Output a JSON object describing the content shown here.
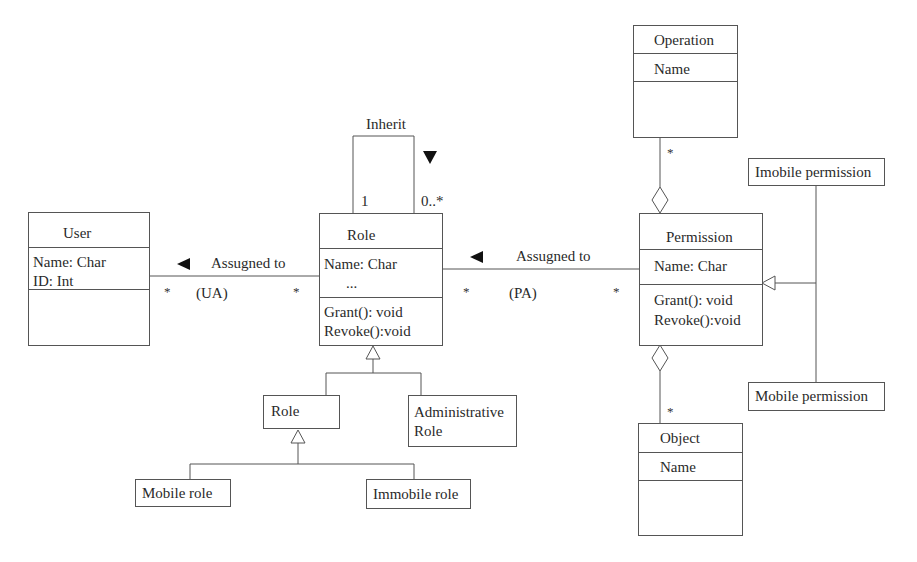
{
  "classes": {
    "user": {
      "name": "User",
      "attributes": [
        "Name: Char",
        "ID: Int"
      ],
      "operations": []
    },
    "role": {
      "name": "Role",
      "attributes": [
        "Name: Char",
        "..."
      ],
      "operations": [
        "Grant(): void",
        "Revoke():void"
      ]
    },
    "permission": {
      "name": "Permission",
      "attributes": [
        "Name: Char"
      ],
      "operations": [
        "Grant(): void",
        "Revoke():void"
      ]
    },
    "operation": {
      "name": "Operation",
      "attributes": [
        "Name"
      ],
      "operations": []
    },
    "object": {
      "name": "Object",
      "attributes": [
        "Name"
      ],
      "operations": []
    },
    "sub_role": {
      "name": "Role"
    },
    "administrative_role": {
      "name_line1": "Administrative",
      "name_line2": "Role"
    },
    "mobile_role": {
      "name": "Mobile role"
    },
    "immobile_role": {
      "name": "Immobile role"
    },
    "imobile_permission": {
      "name": "Imobile permission"
    },
    "mobile_permission": {
      "name": "Mobile permission"
    }
  },
  "associations": {
    "ua": {
      "label": "Assugned to",
      "abbrev": "(UA)",
      "mult_left": "*",
      "mult_right": "*",
      "direction": "left"
    },
    "pa": {
      "label": "Assugned to",
      "abbrev": "(PA)",
      "mult_left": "*",
      "mult_right": "*",
      "direction": "left"
    },
    "inherit": {
      "label": "Inherit",
      "mult_left": "1",
      "mult_right": "0..*",
      "direction": "down"
    },
    "operation_permission": {
      "mult": "*",
      "kind": "aggregation"
    },
    "object_permission": {
      "mult": "*",
      "kind": "aggregation"
    }
  },
  "generalizations": [
    {
      "parent": "Role",
      "children": [
        "Role",
        "Administrative Role"
      ]
    },
    {
      "parent": "Role",
      "children": [
        "Mobile role",
        "Immobile role"
      ]
    },
    {
      "parent": "Permission",
      "children": [
        "Imobile permission",
        "Mobile permission"
      ]
    }
  ]
}
